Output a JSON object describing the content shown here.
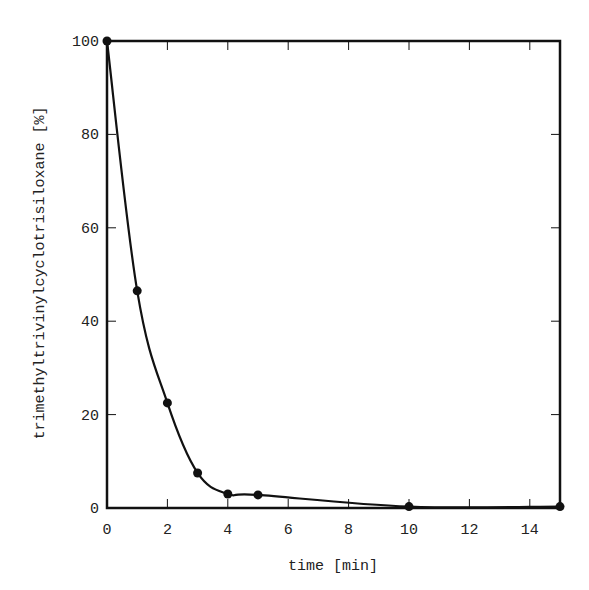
{
  "chart_data": {
    "type": "line",
    "title": "",
    "xlabel": "time [min]",
    "ylabel": "trimethyltrivinylcyclotrisiloxane [%]",
    "xlim": [
      0,
      15
    ],
    "ylim": [
      0,
      100
    ],
    "x_ticks": [
      0,
      2,
      4,
      6,
      8,
      10,
      12,
      14
    ],
    "y_ticks": [
      0,
      20,
      40,
      60,
      80,
      100
    ],
    "grid": false,
    "legend": null,
    "series": [
      {
        "name": "trimethyltrivinylcyclotrisiloxane",
        "marker": "filled-circle",
        "line": "smooth",
        "x": [
          0,
          1,
          2,
          3,
          4,
          5,
          10,
          15
        ],
        "y": [
          100,
          46.5,
          22.5,
          7.5,
          3.0,
          2.8,
          0.3,
          0.3
        ]
      }
    ]
  },
  "colors": {
    "ink": "#111111",
    "background": "#ffffff"
  }
}
